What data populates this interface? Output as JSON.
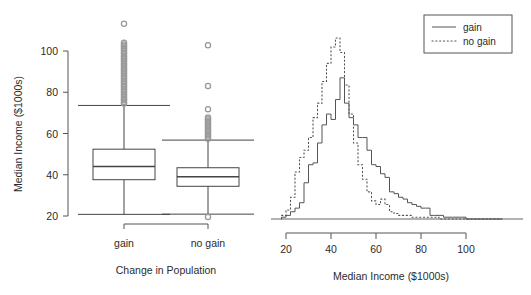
{
  "figure": {
    "background": "#ffffff",
    "ink_color": "#444444",
    "outlier_color": "#9a9a9a",
    "caption_fragment": ""
  },
  "chart_data": [
    {
      "type": "box",
      "panel": "left",
      "title": "",
      "xlabel": "Change in Population",
      "ylabel": "Median Income ($1000s)",
      "ylim": [
        17,
        115
      ],
      "yticks": [
        20,
        40,
        60,
        80,
        100
      ],
      "ytick_labels": [
        "20",
        "40",
        "60",
        "80",
        "100"
      ],
      "categories": [
        "gain",
        "no gain"
      ],
      "grid": false,
      "legend": "none",
      "boxes": [
        {
          "name": "gain",
          "whisker_low": 20.8,
          "q1": 37.6,
          "median": 44.0,
          "q3": 52.4,
          "whisker_high": 73.6,
          "outliers_high": [
            74.5,
            75.3,
            76.1,
            76.9,
            77.6,
            78.4,
            79.2,
            80.0,
            80.8,
            81.6,
            82.4,
            83.2,
            84.0,
            84.8,
            85.6,
            86.4,
            87.2,
            88.0,
            88.8,
            89.6,
            90.4,
            91.2,
            92.0,
            92.8,
            93.6,
            94.4,
            95.2,
            96.0,
            96.8,
            97.6,
            98.4,
            99.2,
            100.0,
            100.8,
            101.6,
            102.4,
            103.2,
            104.0,
            113.2
          ],
          "outliers_low": []
        },
        {
          "name": "no gain",
          "whisker_low": 20.9,
          "q1": 34.4,
          "median": 39.0,
          "q3": 43.4,
          "whisker_high": 56.8,
          "outliers_high": [
            57.4,
            58.2,
            59.0,
            59.8,
            60.6,
            61.4,
            62.2,
            63.0,
            63.8,
            64.6,
            65.4,
            66.2,
            67.0,
            67.8,
            71.8,
            83.0,
            102.8
          ],
          "outliers_low": [
            19.5
          ]
        }
      ]
    },
    {
      "type": "line",
      "panel": "right",
      "title": "",
      "xlabel": "Median Income ($1000s)",
      "ylabel": "",
      "xlim": [
        17,
        118
      ],
      "ylim": [
        0,
        1.0
      ],
      "xticks": [
        20,
        40,
        60,
        80,
        100
      ],
      "xtick_labels": [
        "20",
        "40",
        "60",
        "80",
        "100"
      ],
      "grid": false,
      "legend_position": "top-right",
      "series": [
        {
          "name": "gain",
          "style": "solid",
          "x": [
            19,
            21,
            23,
            25,
            27,
            29,
            31,
            33,
            35,
            37,
            39,
            41,
            43,
            45,
            47,
            49,
            51,
            53,
            55,
            57,
            59,
            61,
            63,
            65,
            67,
            69,
            71,
            73,
            75,
            77,
            79,
            81,
            83,
            85,
            87,
            89,
            91,
            93,
            95,
            97,
            99,
            101,
            103,
            105,
            107,
            109,
            111,
            113,
            115
          ],
          "values": [
            0.01,
            0.02,
            0.04,
            0.06,
            0.09,
            0.2,
            0.3,
            0.31,
            0.42,
            0.52,
            0.58,
            0.55,
            0.66,
            0.78,
            0.64,
            0.56,
            0.52,
            0.45,
            0.45,
            0.38,
            0.3,
            0.29,
            0.25,
            0.23,
            0.15,
            0.14,
            0.12,
            0.11,
            0.09,
            0.08,
            0.07,
            0.06,
            0.06,
            0.02,
            0.02,
            0.02,
            0.01,
            0.01,
            0.01,
            0.01,
            0.01,
            0.0,
            0.0,
            0.0,
            0.0,
            0.0,
            0.0,
            0.0,
            0.0
          ]
        },
        {
          "name": "no gain",
          "style": "dotted",
          "x": [
            19,
            21,
            23,
            25,
            27,
            29,
            31,
            33,
            35,
            37,
            39,
            41,
            43,
            45,
            47,
            49,
            51,
            53,
            55,
            57,
            59,
            61,
            63,
            65,
            67,
            69,
            71,
            73,
            75,
            77,
            79,
            81,
            83,
            85,
            87,
            89,
            91,
            93,
            95,
            97,
            99,
            101,
            103,
            105,
            107,
            109,
            111,
            113,
            115
          ],
          "values": [
            0.02,
            0.05,
            0.12,
            0.26,
            0.34,
            0.38,
            0.45,
            0.56,
            0.64,
            0.76,
            0.86,
            0.95,
            1.0,
            0.92,
            0.74,
            0.58,
            0.42,
            0.3,
            0.22,
            0.15,
            0.1,
            0.08,
            0.11,
            0.08,
            0.04,
            0.03,
            0.02,
            0.02,
            0.02,
            0.01,
            0.01,
            0.01,
            0.01,
            0.01,
            0.01,
            0.0,
            0.0,
            0.0,
            0.0,
            0.0,
            0.0,
            0.0,
            0.0,
            0.0,
            0.0,
            0.0,
            0.0,
            0.0,
            0.0
          ]
        }
      ],
      "legend_entries": [
        {
          "label": "gain",
          "style": "solid"
        },
        {
          "label": "no gain",
          "style": "dotted"
        }
      ]
    }
  ]
}
